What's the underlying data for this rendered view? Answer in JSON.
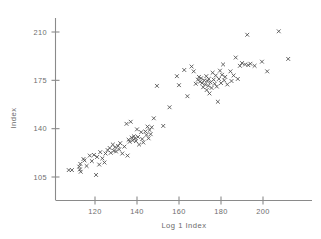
{
  "chart_data": {
    "type": "scatter",
    "title": "",
    "xlabel": "Log 1 Index",
    "ylabel": "Index",
    "marker": "x",
    "marker_color": "#4a4a4a",
    "grid": false,
    "legend": false,
    "xlim": [
      105,
      215
    ],
    "ylim": [
      100,
      215
    ],
    "xticks": [
      120,
      140,
      160,
      180,
      200
    ],
    "xtick_labels": [
      "120",
      "140",
      "160",
      "180",
      "200"
    ],
    "yticks": [
      105,
      140,
      175,
      210
    ],
    "ytick_labels": [
      "105",
      "140",
      "175",
      "210"
    ],
    "points": [
      [
        107.5,
        110.0
      ],
      [
        109.0,
        110.0
      ],
      [
        112.5,
        112.5
      ],
      [
        112.8,
        110.5
      ],
      [
        113.0,
        114.5
      ],
      [
        113.2,
        108.8
      ],
      [
        114.5,
        118.0
      ],
      [
        115.0,
        117.0
      ],
      [
        116.0,
        113.0
      ],
      [
        117.5,
        120.5
      ],
      [
        118.5,
        116.5
      ],
      [
        119.5,
        121.0
      ],
      [
        120.5,
        106.5
      ],
      [
        121.0,
        119.5
      ],
      [
        122.0,
        114.0
      ],
      [
        122.5,
        123.0
      ],
      [
        123.5,
        118.5
      ],
      [
        124.5,
        115.5
      ],
      [
        125.0,
        122.0
      ],
      [
        126.0,
        124.5
      ],
      [
        127.0,
        126.0
      ],
      [
        127.5,
        122.5
      ],
      [
        128.5,
        128.5
      ],
      [
        129.0,
        124.0
      ],
      [
        129.5,
        126.5
      ],
      [
        130.0,
        123.5
      ],
      [
        131.0,
        127.5
      ],
      [
        131.5,
        125.0
      ],
      [
        132.0,
        129.5
      ],
      [
        133.0,
        122.0
      ],
      [
        134.0,
        127.0
      ],
      [
        135.0,
        143.5
      ],
      [
        135.5,
        120.5
      ],
      [
        136.0,
        132.0
      ],
      [
        136.5,
        130.5
      ],
      [
        137.0,
        145.0
      ],
      [
        137.5,
        133.5
      ],
      [
        138.0,
        131.5
      ],
      [
        138.5,
        134.5
      ],
      [
        139.0,
        133.0
      ],
      [
        139.5,
        131.0
      ],
      [
        140.0,
        139.5
      ],
      [
        140.5,
        134.0
      ],
      [
        141.0,
        128.5
      ],
      [
        142.0,
        137.5
      ],
      [
        142.5,
        132.5
      ],
      [
        143.0,
        130.0
      ],
      [
        144.0,
        138.0
      ],
      [
        144.5,
        135.5
      ],
      [
        145.0,
        141.5
      ],
      [
        145.5,
        133.0
      ],
      [
        146.0,
        139.0
      ],
      [
        146.5,
        136.0
      ],
      [
        147.0,
        141.0
      ],
      [
        148.0,
        147.5
      ],
      [
        149.5,
        171.0
      ],
      [
        152.5,
        142.0
      ],
      [
        155.5,
        155.5
      ],
      [
        159.0,
        178.0
      ],
      [
        160.0,
        171.5
      ],
      [
        162.5,
        182.5
      ],
      [
        164.0,
        163.5
      ],
      [
        166.0,
        185.0
      ],
      [
        167.0,
        181.5
      ],
      [
        168.0,
        172.5
      ],
      [
        169.0,
        175.5
      ],
      [
        169.5,
        177.5
      ],
      [
        170.0,
        174.0
      ],
      [
        170.5,
        176.5
      ],
      [
        171.0,
        173.0
      ],
      [
        171.5,
        170.0
      ],
      [
        172.0,
        175.0
      ],
      [
        172.5,
        172.0
      ],
      [
        173.0,
        178.0
      ],
      [
        173.2,
        168.0
      ],
      [
        173.5,
        174.5
      ],
      [
        174.0,
        171.0
      ],
      [
        174.2,
        176.0
      ],
      [
        174.5,
        165.5
      ],
      [
        175.0,
        173.5
      ],
      [
        175.5,
        169.5
      ],
      [
        176.0,
        180.5
      ],
      [
        176.5,
        175.5
      ],
      [
        177.0,
        172.5
      ],
      [
        177.5,
        178.5
      ],
      [
        178.0,
        170.5
      ],
      [
        178.5,
        159.5
      ],
      [
        179.0,
        176.0
      ],
      [
        179.5,
        182.0
      ],
      [
        180.0,
        173.0
      ],
      [
        180.5,
        179.0
      ],
      [
        181.0,
        186.5
      ],
      [
        181.5,
        175.0
      ],
      [
        182.0,
        177.5
      ],
      [
        183.0,
        172.0
      ],
      [
        184.5,
        181.5
      ],
      [
        185.0,
        174.5
      ],
      [
        186.0,
        178.5
      ],
      [
        187.0,
        191.5
      ],
      [
        188.0,
        176.0
      ],
      [
        189.0,
        185.5
      ],
      [
        190.0,
        187.5
      ],
      [
        191.5,
        186.5
      ],
      [
        192.5,
        208.0
      ],
      [
        193.0,
        186.0
      ],
      [
        194.0,
        187.0
      ],
      [
        196.0,
        185.5
      ],
      [
        199.5,
        188.5
      ],
      [
        202.0,
        181.5
      ],
      [
        207.5,
        210.5
      ],
      [
        212.0,
        190.5
      ]
    ]
  },
  "axes": {
    "x_axis_name": "x-axis",
    "y_axis_name": "y-axis"
  }
}
